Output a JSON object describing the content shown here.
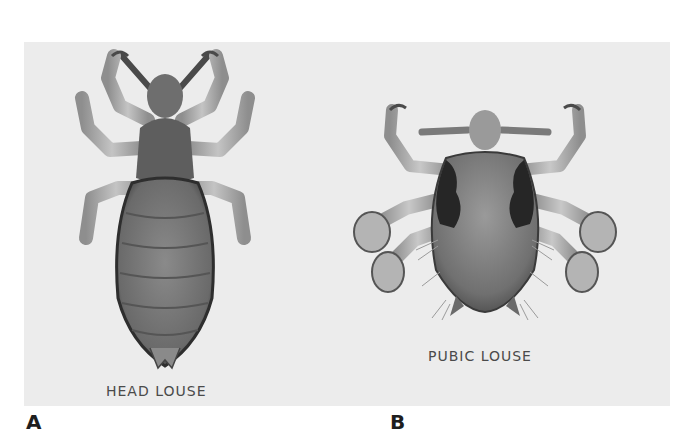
{
  "figure": {
    "panels": [
      {
        "letter": "A",
        "caption": "HEAD LOUSE",
        "icon": "head-louse-illustration"
      },
      {
        "letter": "B",
        "caption": "PUBIC LOUSE",
        "icon": "pubic-louse-illustration"
      }
    ],
    "colors": {
      "panel_background": "#ececec",
      "page_background": "#ffffff",
      "body_dark": "#3a3a3a",
      "body_mid": "#7a7a7a",
      "legs": "#b0b0b0"
    }
  }
}
